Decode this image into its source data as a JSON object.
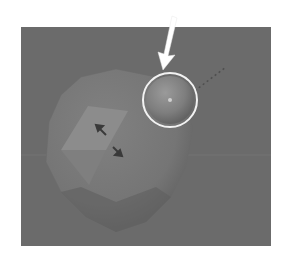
{
  "viewport": {
    "name": "3d-viewport",
    "background_color": "#6b6b6b",
    "grid_line_color": "#747474"
  },
  "objects": {
    "icosphere": {
      "label": "",
      "color": "#7a7a7a",
      "shade_color": "#5f5f5f"
    },
    "face_highlight": {
      "color": "#8c8c8c"
    },
    "selected_sphere": {
      "color": "#8a8a8a",
      "ring_color": "#f2f2f2"
    }
  },
  "annotation": {
    "arrow_color": "#ffffff"
  }
}
